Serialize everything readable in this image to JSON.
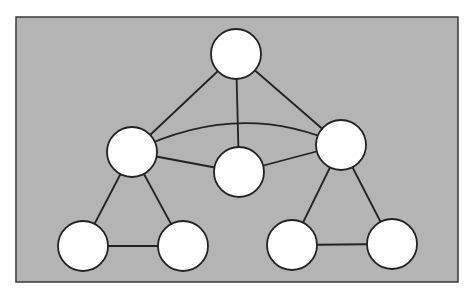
{
  "diagram": {
    "type": "graph",
    "colors": {
      "page_background": "#ffffff",
      "panel_fill": "#b4b4b4",
      "panel_border": "#3a3a3a",
      "node_fill": "#ffffff",
      "node_stroke": "#222222",
      "edge_stroke": "#222222"
    },
    "panel": {
      "x": 16,
      "y": 17,
      "width": 442,
      "height": 265
    },
    "node_radius": 25,
    "nodes": [
      {
        "id": "top",
        "x": 236,
        "y": 54
      },
      {
        "id": "mid-left",
        "x": 132,
        "y": 152
      },
      {
        "id": "center",
        "x": 239,
        "y": 172
      },
      {
        "id": "mid-right",
        "x": 341,
        "y": 145
      },
      {
        "id": "bottom-left-1",
        "x": 83,
        "y": 246
      },
      {
        "id": "bottom-left-2",
        "x": 183,
        "y": 246
      },
      {
        "id": "bottom-right-1",
        "x": 292,
        "y": 245
      },
      {
        "id": "bottom-right-2",
        "x": 392,
        "y": 244
      }
    ],
    "edges": [
      {
        "from": "top",
        "to": "mid-left"
      },
      {
        "from": "top",
        "to": "center"
      },
      {
        "from": "top",
        "to": "mid-right"
      },
      {
        "from": "mid-left",
        "to": "center"
      },
      {
        "from": "center",
        "to": "mid-right"
      },
      {
        "from": "mid-left",
        "to": "mid-right",
        "curved": true,
        "control": {
          "x": 240,
          "y": 98
        }
      },
      {
        "from": "mid-left",
        "to": "bottom-left-1"
      },
      {
        "from": "mid-left",
        "to": "bottom-left-2"
      },
      {
        "from": "bottom-left-1",
        "to": "bottom-left-2"
      },
      {
        "from": "mid-right",
        "to": "bottom-right-1"
      },
      {
        "from": "mid-right",
        "to": "bottom-right-2"
      },
      {
        "from": "bottom-right-1",
        "to": "bottom-right-2"
      }
    ]
  }
}
